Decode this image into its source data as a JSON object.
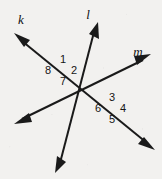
{
  "figure": {
    "type": "geometry-diagram",
    "background_color": "#f2f1ef",
    "stroke_color": "#1a1a1a",
    "width": 162,
    "height": 179
  },
  "lines": [
    {
      "id": "k",
      "label": "k",
      "label_x": 21,
      "label_y": 13,
      "arrow_start": {
        "x": 17,
        "y": 36
      },
      "arrow_end": {
        "x": 152,
        "y": 147
      },
      "double_headed": true
    },
    {
      "id": "l",
      "label": "l",
      "label_x": 88,
      "label_y": 8,
      "arrow_start": {
        "x": 97,
        "y": 26
      },
      "arrow_end": {
        "x": 57,
        "y": 170
      },
      "double_headed": true
    },
    {
      "id": "m",
      "label": "m",
      "label_x": 138,
      "label_y": 45,
      "arrow_start": {
        "x": 148,
        "y": 57
      },
      "arrow_end": {
        "x": 17,
        "y": 122
      },
      "double_headed": true
    }
  ],
  "intersections": [
    {
      "id": "left",
      "x": 62,
      "y": 72,
      "lines": [
        "k",
        "l"
      ],
      "angles": [
        "1",
        "8",
        "2",
        "7"
      ]
    },
    {
      "id": "right",
      "x": 111,
      "y": 110,
      "lines": [
        "k",
        "m"
      ],
      "angles": [
        "3",
        "6",
        "4",
        "5"
      ]
    }
  ],
  "angle_labels": [
    {
      "id": "angle-1",
      "text": "1",
      "x": 57,
      "y": 54
    },
    {
      "id": "angle-2",
      "text": "2",
      "x": 68,
      "y": 65
    },
    {
      "id": "angle-8",
      "text": "8",
      "x": 42,
      "y": 65
    },
    {
      "id": "angle-7",
      "text": "7",
      "x": 57,
      "y": 76
    },
    {
      "id": "angle-3",
      "text": "3",
      "x": 106,
      "y": 92
    },
    {
      "id": "angle-4",
      "text": "4",
      "x": 117,
      "y": 103
    },
    {
      "id": "angle-6",
      "text": "6",
      "x": 92,
      "y": 103
    },
    {
      "id": "angle-5",
      "text": "5",
      "x": 106,
      "y": 114
    }
  ]
}
